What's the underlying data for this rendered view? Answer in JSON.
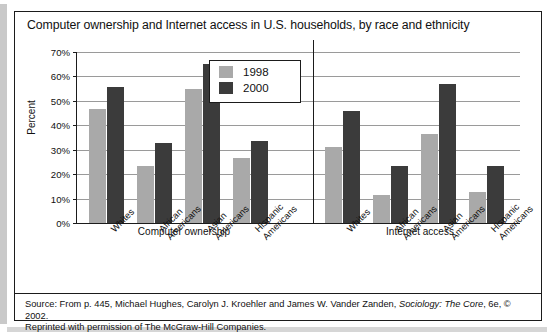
{
  "figure": {
    "title": "Computer ownership and Internet access in U.S. households, by race and ethnicity",
    "source_prefix": "Source: From p. 445, Michael Hughes, Carolyn J. Kroehler and James W. Vander Zanden, ",
    "source_italic": "Sociology: The Core",
    "source_suffix": ", 6e, © 2002.",
    "source_line2": "Reprinted with permission of The McGraw-Hill Companies."
  },
  "colors": {
    "series_1998": "#a9a9a9",
    "series_2000": "#3b3b3b",
    "axis": "#1b1b1b",
    "grid": "#9a9a9a"
  },
  "chart_data": {
    "type": "bar",
    "title": "Computer ownership and Internet access in U.S. households, by race and ethnicity",
    "xlabel": "",
    "ylabel": "Percent",
    "ylim": [
      0,
      70
    ],
    "ytick_labels": [
      "0%",
      "10%",
      "20%",
      "30%",
      "40%",
      "50%",
      "60%",
      "70%"
    ],
    "ytick_values": [
      0,
      10,
      20,
      30,
      40,
      50,
      60,
      70
    ],
    "grid": true,
    "legend_position": "top-center",
    "panels": [
      {
        "name": "Computer ownership",
        "categories": [
          [
            "Whites"
          ],
          [
            "African",
            "Americans"
          ],
          [
            "Asian",
            "Americans"
          ],
          [
            "Hispanic",
            "Americans"
          ]
        ],
        "series": [
          {
            "name": "1998",
            "values": [
              46.5,
              23.2,
              55.0,
              26.5
            ]
          },
          {
            "name": "2000",
            "values": [
              55.7,
              32.6,
              65.0,
              33.5
            ]
          }
        ]
      },
      {
        "name": "Internet access",
        "categories": [
          [
            "Whites"
          ],
          [
            "African",
            "Americans"
          ],
          [
            "Asian",
            "Americans"
          ],
          [
            "Hispanic",
            "Americans"
          ]
        ],
        "series": [
          {
            "name": "1998",
            "values": [
              31.0,
              11.5,
              36.5,
              12.5
            ]
          },
          {
            "name": "2000",
            "values": [
              46.0,
              23.5,
              57.0,
              23.5
            ]
          }
        ]
      }
    ],
    "legend": [
      {
        "label": "1998",
        "color": "#a9a9a9"
      },
      {
        "label": "2000",
        "color": "#3b3b3b"
      }
    ]
  }
}
